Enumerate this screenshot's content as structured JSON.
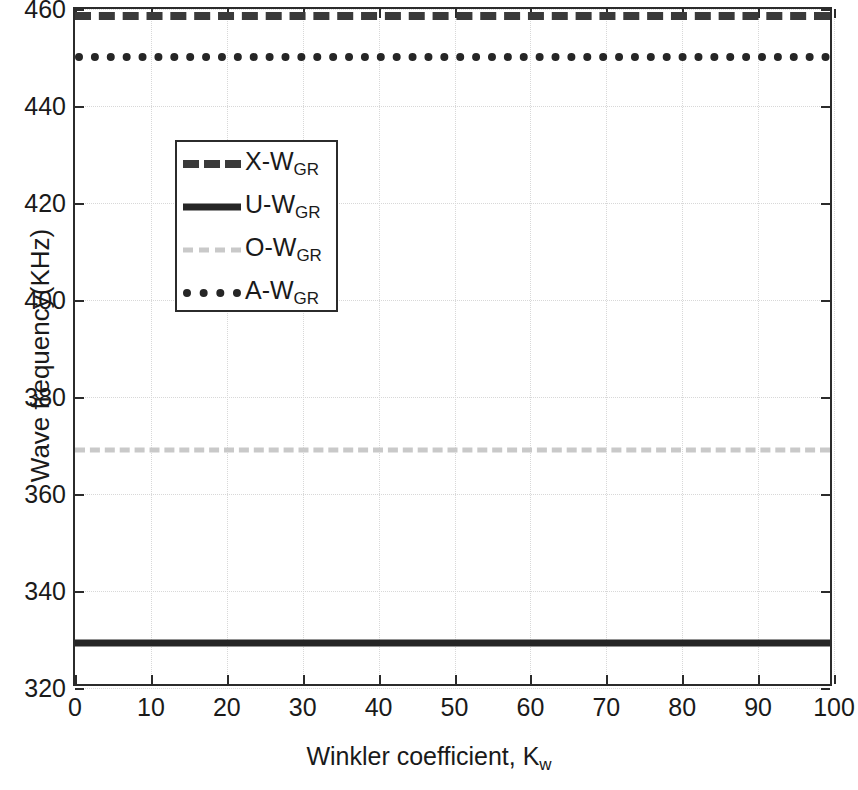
{
  "chart_data": {
    "type": "line",
    "title": "",
    "xlabel": "Winkler coefficient, K",
    "xlabel_sub": "w",
    "ylabel": "Wave frequency(KHz)",
    "xlim": [
      0,
      100
    ],
    "ylim": [
      320,
      460
    ],
    "xticks": [
      0,
      10,
      20,
      30,
      40,
      50,
      60,
      70,
      80,
      90,
      100
    ],
    "yticks": [
      320,
      340,
      360,
      380,
      400,
      420,
      440,
      460
    ],
    "grid": true,
    "legend_position": "upper left",
    "x": [
      0,
      10,
      20,
      30,
      40,
      50,
      60,
      70,
      80,
      90,
      100
    ],
    "series": [
      {
        "name": "X-W",
        "name_sub": "GR",
        "style": "dashed",
        "color": "#3a3a3a",
        "value": 458.5,
        "values": [
          458.5,
          458.5,
          458.5,
          458.5,
          458.5,
          458.5,
          458.5,
          458.5,
          458.5,
          458.5,
          458.5
        ]
      },
      {
        "name": "U-W",
        "name_sub": "GR",
        "style": "solid",
        "color": "#262626",
        "value": 329.2,
        "values": [
          329.2,
          329.2,
          329.2,
          329.2,
          329.2,
          329.2,
          329.2,
          329.2,
          329.2,
          329.2,
          329.2
        ]
      },
      {
        "name": "O-W",
        "name_sub": "GR",
        "style": "dashdot",
        "color": "#c9c9c9",
        "value": 369.0,
        "values": [
          369.0,
          369.0,
          369.0,
          369.0,
          369.0,
          369.0,
          369.0,
          369.0,
          369.0,
          369.0,
          369.0
        ]
      },
      {
        "name": "A-W",
        "name_sub": "GR",
        "style": "dotted",
        "color": "#262626",
        "value": 450.2,
        "values": [
          450.2,
          450.2,
          450.2,
          450.2,
          450.2,
          450.2,
          450.2,
          450.2,
          450.2,
          450.2,
          450.2
        ]
      }
    ]
  },
  "axis": {
    "ytick_labels": [
      "320",
      "340",
      "360",
      "380",
      "400",
      "420",
      "440",
      "460"
    ],
    "xtick_labels": [
      "0",
      "10",
      "20",
      "30",
      "40",
      "50",
      "60",
      "70",
      "80",
      "90",
      "100"
    ]
  },
  "legend": {
    "entries": [
      {
        "label": "X-W",
        "sub": "GR"
      },
      {
        "label": "U-W",
        "sub": "GR"
      },
      {
        "label": "O-W",
        "sub": "GR"
      },
      {
        "label": "A-W",
        "sub": "GR"
      }
    ]
  }
}
